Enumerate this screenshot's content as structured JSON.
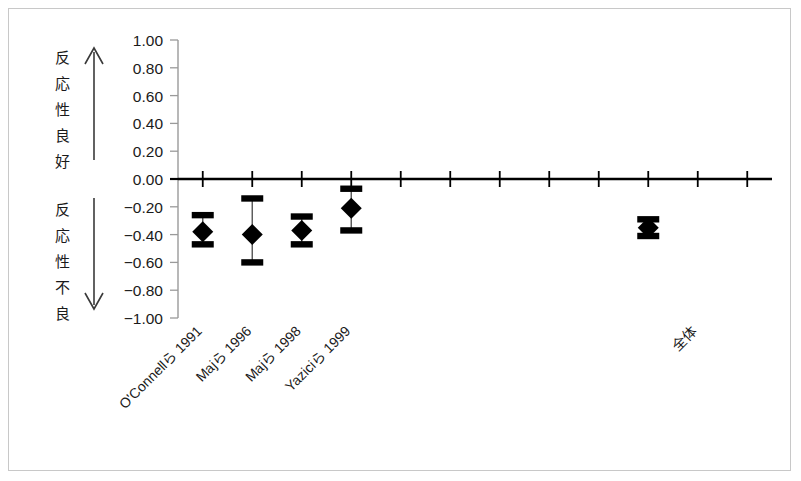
{
  "figure": {
    "background_color": "#ffffff",
    "frame_color": "#c8c8c8",
    "marker_color": "#000000",
    "axis_color": "#000000",
    "tick_color": "#9a9a9a"
  },
  "annotations": {
    "upper_label": "反応性良好",
    "upper_label_chars": [
      "反",
      "応",
      "性",
      "良",
      "好"
    ],
    "lower_label": "反応性不良",
    "lower_label_chars": [
      "反",
      "応",
      "性",
      "不",
      "良"
    ],
    "upper_arrow": "arrow-up",
    "lower_arrow": "arrow-down"
  },
  "chart_data": {
    "type": "scatter",
    "title": "",
    "xlabel": "",
    "ylabel": "",
    "ylim": [
      -1.0,
      1.0
    ],
    "grid": false,
    "legend": "none",
    "zero_reference_line": 0.0,
    "y_ticks": [
      1.0,
      0.8,
      0.6,
      0.4,
      0.2,
      0.0,
      -0.2,
      -0.4,
      -0.6,
      -0.8,
      -1.0
    ],
    "y_tick_labels": [
      "1.00",
      "0.80",
      "0.60",
      "0.40",
      "0.20",
      "0.00",
      "−0.20",
      "−0.40",
      "−0.60",
      "−0.80",
      "−1.00"
    ],
    "categories": [
      "O'Connellら 1991",
      "Majら 1996",
      "Majら 1998",
      "Yaziciら 1999",
      "",
      "",
      "",
      "",
      "",
      "",
      "全体",
      ""
    ],
    "x_tick_count": 12,
    "points": [
      {
        "category": "O'Connellら 1991",
        "slot": 0,
        "value": -0.38,
        "ci_low": -0.47,
        "ci_high": -0.26
      },
      {
        "category": "Majら 1996",
        "slot": 1,
        "value": -0.4,
        "ci_low": -0.6,
        "ci_high": -0.14
      },
      {
        "category": "Majら 1998",
        "slot": 2,
        "value": -0.37,
        "ci_low": -0.47,
        "ci_high": -0.27
      },
      {
        "category": "Yaziciら 1999",
        "slot": 3,
        "value": -0.21,
        "ci_low": -0.37,
        "ci_high": -0.07
      },
      {
        "category": "全体",
        "slot": 9,
        "value": -0.35,
        "ci_low": -0.41,
        "ci_high": -0.29
      }
    ]
  }
}
